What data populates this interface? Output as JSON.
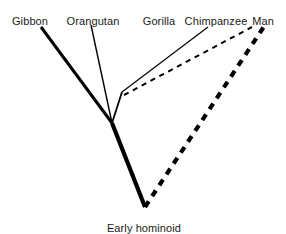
{
  "figure": {
    "type": "phylogenetic-tree",
    "background_color": "#ffffff",
    "line_color": "#000000",
    "text_color": "#1a1a1a"
  },
  "labels": {
    "tips": [
      {
        "id": "gibbon",
        "text": "Gibbon",
        "x": 30,
        "y": 16
      },
      {
        "id": "orangutan",
        "text": "Orangutan",
        "x": 93,
        "y": 16
      },
      {
        "id": "gorilla",
        "text": "Gorilla",
        "x": 159,
        "y": 16
      },
      {
        "id": "chimpanzee",
        "text": "Chimpanzee",
        "x": 216,
        "y": 16
      },
      {
        "id": "man",
        "text": "Man",
        "x": 263,
        "y": 16
      }
    ],
    "root": {
      "id": "early-hominoid",
      "text": "Early hominoid",
      "x": 144,
      "y": 223
    }
  },
  "chart_data": {
    "type": "tree",
    "title": "",
    "taxa": [
      "Gibbon",
      "Orangutan",
      "Gorilla",
      "Chimpanzee",
      "Man"
    ],
    "root_name": "Early hominoid",
    "nodes": [
      {
        "id": "root",
        "label": "Early hominoid",
        "x": 145,
        "y": 207
      },
      {
        "id": "node-gibbon-split",
        "label": "",
        "x": 112,
        "y": 123
      },
      {
        "id": "node-gorilla-chimp-split",
        "label": "",
        "x": 122,
        "y": 92
      }
    ],
    "branches": [
      {
        "id": "branch-root-to-gibbon-split",
        "from": "root",
        "to": "node-gibbon-split",
        "x1": 145,
        "y1": 207,
        "x2": 112,
        "y2": 123,
        "style": "solid",
        "width": 4.2
      },
      {
        "id": "branch-gibbon",
        "from": "node-gibbon-split",
        "to": "Gibbon",
        "x1": 112,
        "y1": 123,
        "x2": 41,
        "y2": 27,
        "style": "solid",
        "width": 3.0
      },
      {
        "id": "branch-orangutan",
        "from": "node-gibbon-split",
        "to": "Orangutan",
        "x1": 112,
        "y1": 123,
        "x2": 91,
        "y2": 25,
        "style": "solid",
        "width": 1.4
      },
      {
        "id": "branch-gibbon-split-to-gorilla-split",
        "from": "node-gibbon-split",
        "to": "node-gorilla-chimp-split",
        "x1": 112,
        "y1": 123,
        "x2": 122,
        "y2": 92,
        "style": "solid",
        "width": 1.8
      },
      {
        "id": "branch-gorilla",
        "from": "node-gorilla-chimp-split",
        "to": "Gorilla",
        "x1": 122,
        "y1": 92,
        "x2": 208,
        "y2": 27,
        "style": "solid",
        "width": 1.2
      },
      {
        "id": "branch-chimpanzee",
        "from": "node-gorilla-chimp-split",
        "to": "Chimpanzee",
        "x1": 124,
        "y1": 95,
        "x2": 252,
        "y2": 27,
        "style": "dashed",
        "width": 2.0
      },
      {
        "id": "branch-man",
        "from": "root",
        "to": "Man",
        "x1": 145,
        "y1": 207,
        "x2": 265,
        "y2": 25,
        "style": "dashed",
        "width": 4.2
      }
    ],
    "legend": [],
    "grid": false,
    "axis": false
  }
}
